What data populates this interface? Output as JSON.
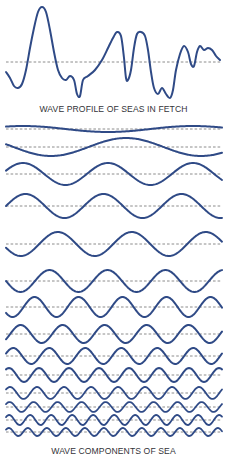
{
  "colors": {
    "wave": "#2f4a86",
    "baseline": "#6e6e6e",
    "background": "#ffffff",
    "text": "#333338"
  },
  "captions": {
    "profile": "WAVE PROFILE OF SEAS IN FETCH",
    "components": "WAVE COMPONENTS OF SEA"
  },
  "profile": {
    "baseline_y": 62,
    "x_start": 6,
    "x_end": 222,
    "points": [
      [
        6,
        72
      ],
      [
        10,
        78
      ],
      [
        14,
        86
      ],
      [
        18,
        88
      ],
      [
        22,
        84
      ],
      [
        26,
        70
      ],
      [
        30,
        48
      ],
      [
        34,
        28
      ],
      [
        38,
        12
      ],
      [
        42,
        7
      ],
      [
        46,
        12
      ],
      [
        50,
        30
      ],
      [
        54,
        52
      ],
      [
        58,
        70
      ],
      [
        62,
        78
      ],
      [
        66,
        80
      ],
      [
        70,
        76
      ],
      [
        74,
        80
      ],
      [
        77,
        94
      ],
      [
        80,
        96
      ],
      [
        83,
        80
      ],
      [
        88,
        76
      ],
      [
        95,
        70
      ],
      [
        102,
        60
      ],
      [
        108,
        48
      ],
      [
        113,
        38
      ],
      [
        117,
        32
      ],
      [
        121,
        36
      ],
      [
        124,
        58
      ],
      [
        126,
        78
      ],
      [
        128,
        80
      ],
      [
        131,
        70
      ],
      [
        134,
        48
      ],
      [
        137,
        34
      ],
      [
        141,
        32
      ],
      [
        145,
        36
      ],
      [
        148,
        50
      ],
      [
        151,
        72
      ],
      [
        154,
        88
      ],
      [
        158,
        94
      ],
      [
        162,
        88
      ],
      [
        166,
        94
      ],
      [
        170,
        98
      ],
      [
        173,
        90
      ],
      [
        176,
        70
      ],
      [
        180,
        54
      ],
      [
        184,
        46
      ],
      [
        188,
        52
      ],
      [
        191,
        64
      ],
      [
        194,
        66
      ],
      [
        197,
        52
      ],
      [
        200,
        46
      ],
      [
        204,
        50
      ],
      [
        208,
        48
      ],
      [
        212,
        50
      ],
      [
        216,
        56
      ],
      [
        220,
        60
      ]
    ]
  },
  "components": {
    "x_start": 6,
    "x_end": 222,
    "rows": [
      {
        "baseline_y": 129,
        "amplitude": 3,
        "wavelength": 170,
        "phase": 0.15
      },
      {
        "baseline_y": 147,
        "amplitude": 9,
        "wavelength": 150,
        "phase": -0.55
      },
      {
        "baseline_y": 174,
        "amplitude": 11,
        "wavelength": 85,
        "phase": 0.05
      },
      {
        "baseline_y": 206,
        "amplitude": 12,
        "wavelength": 78,
        "phase": 0.0
      },
      {
        "baseline_y": 244,
        "amplitude": 12,
        "wavelength": 74,
        "phase": -0.45
      },
      {
        "baseline_y": 281,
        "amplitude": 11,
        "wavelength": 58,
        "phase": -0.5
      },
      {
        "baseline_y": 307,
        "amplitude": 10,
        "wavelength": 44,
        "phase": 0.6
      },
      {
        "baseline_y": 334,
        "amplitude": 9,
        "wavelength": 42,
        "phase": -0.1
      },
      {
        "baseline_y": 356,
        "amplitude": 8,
        "wavelength": 36,
        "phase": 0.05
      },
      {
        "baseline_y": 375,
        "amplitude": 7,
        "wavelength": 30,
        "phase": 0.15
      },
      {
        "baseline_y": 393,
        "amplitude": 6,
        "wavelength": 27,
        "phase": 0.1
      },
      {
        "baseline_y": 407,
        "amplitude": 5,
        "wavelength": 24,
        "phase": 0.1
      },
      {
        "baseline_y": 420,
        "amplitude": 5,
        "wavelength": 21,
        "phase": 0.1
      },
      {
        "baseline_y": 432,
        "amplitude": 4,
        "wavelength": 19,
        "phase": 0.1
      }
    ]
  }
}
